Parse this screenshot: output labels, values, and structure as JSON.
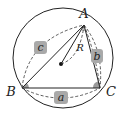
{
  "diagram": {
    "vertices": {
      "A": {
        "label": "A",
        "x": 84,
        "y": 25
      },
      "B": {
        "label": "B",
        "x": 22,
        "y": 88
      },
      "C": {
        "label": "C",
        "x": 100,
        "y": 88
      }
    },
    "circle": {
      "cx": 63,
      "cy": 58,
      "r": 50
    },
    "center_dot": {
      "x": 61,
      "y": 64
    },
    "sides": {
      "a": {
        "label": "a"
      },
      "b": {
        "label": "b"
      },
      "c": {
        "label": "c"
      }
    },
    "radius_label": "R",
    "colors": {
      "stroke": "#222222",
      "badge": "#a9a9a9",
      "wedge": "#9a9a9a"
    }
  }
}
